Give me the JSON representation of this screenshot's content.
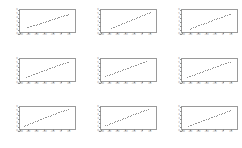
{
  "figure": {
    "title": "",
    "background_color": "#ffffff",
    "frame_color": "#9a9a9a",
    "marker_color": "#6e6e6e",
    "tick_label_color": "#8f8f8f",
    "rows": 3,
    "cols": 3
  },
  "chart_data": [
    {
      "type": "scatter",
      "title": "",
      "xlabel": "",
      "ylabel": "",
      "xlim": [
        -100,
        40
      ],
      "ylim": [
        0,
        6
      ],
      "xticks": [
        -100,
        -80,
        -60,
        -40,
        -20,
        0,
        20
      ],
      "yticks": [
        0,
        1,
        2,
        3,
        4,
        5,
        6
      ],
      "xticklabels": [
        "-100",
        "-80",
        "-60",
        "-40",
        "-20",
        "0",
        "20"
      ],
      "yticklabels": [
        "0",
        "1",
        "2",
        "3",
        "4",
        "5",
        "6"
      ],
      "grid": false,
      "legend": null,
      "x": [
        -82,
        -78,
        -75,
        -71,
        -68,
        -64,
        -60,
        -57,
        -53,
        -49,
        -46,
        -42,
        -38,
        -35,
        -31,
        -27,
        -24,
        -20,
        -16,
        -13,
        -9,
        -5,
        -2,
        2,
        6,
        9,
        13,
        17,
        20
      ],
      "y": [
        1.55,
        1.72,
        1.78,
        1.95,
        2.02,
        2.18,
        2.25,
        2.42,
        2.48,
        2.65,
        2.72,
        2.88,
        2.95,
        3.12,
        3.18,
        3.35,
        3.42,
        3.58,
        3.65,
        3.82,
        3.88,
        4.05,
        4.12,
        4.28,
        4.35,
        4.52,
        4.58,
        4.75,
        4.82
      ]
    },
    {
      "type": "scatter",
      "title": "",
      "xlabel": "",
      "ylabel": "",
      "xlim": [
        -100,
        40
      ],
      "ylim": [
        0,
        6
      ],
      "xticks": [
        -100,
        -80,
        -60,
        -40,
        -20,
        0,
        20
      ],
      "yticks": [
        0,
        1,
        2,
        3,
        4,
        5,
        6
      ],
      "xticklabels": [
        "-100",
        "-80",
        "-60",
        "-40",
        "-20",
        "0",
        "20"
      ],
      "yticklabels": [
        "0",
        "1",
        "2",
        "3",
        "4",
        "5",
        "6"
      ],
      "grid": false,
      "legend": null,
      "x": [
        -74,
        -70,
        -66,
        -62,
        -58,
        -54,
        -50,
        -46,
        -42,
        -38,
        -34,
        -30,
        -26,
        -22,
        -18,
        -14,
        -10,
        -6,
        -2,
        2,
        6,
        10,
        14,
        18,
        22
      ],
      "y": [
        1.32,
        1.52,
        1.68,
        1.85,
        2.02,
        2.18,
        2.35,
        2.52,
        2.68,
        2.85,
        3.02,
        3.18,
        3.35,
        3.52,
        3.68,
        3.85,
        4.02,
        4.18,
        4.35,
        4.52,
        4.68,
        4.85,
        5.02,
        5.15,
        5.28
      ]
    },
    {
      "type": "scatter",
      "title": "",
      "xlabel": "",
      "ylabel": "",
      "xlim": [
        -100,
        40
      ],
      "ylim": [
        0,
        6
      ],
      "xticks": [
        -100,
        -80,
        -60,
        -40,
        -20,
        0,
        20
      ],
      "yticks": [
        0,
        1,
        2,
        3,
        4,
        5,
        6
      ],
      "xticklabels": [
        "-100",
        "-80",
        "-60",
        "-40",
        "-20",
        "0",
        "20"
      ],
      "yticklabels": [
        "0",
        "1",
        "2",
        "3",
        "4",
        "5",
        "6"
      ],
      "grid": false,
      "legend": null,
      "x": [
        -80,
        -76,
        -72,
        -68,
        -64,
        -60,
        -56,
        -52,
        -48,
        -44,
        -40,
        -36,
        -32,
        -28,
        -24,
        -20,
        -16,
        -12,
        -8,
        -4,
        0,
        4,
        8,
        12,
        16,
        20
      ],
      "y": [
        1.25,
        1.42,
        1.55,
        1.72,
        1.85,
        2.02,
        2.15,
        2.32,
        2.45,
        2.62,
        2.75,
        2.92,
        3.05,
        3.22,
        3.35,
        3.52,
        3.65,
        3.82,
        3.95,
        4.12,
        4.25,
        4.42,
        4.55,
        4.72,
        4.85,
        5.0
      ]
    },
    {
      "type": "scatter",
      "title": "",
      "xlabel": "",
      "ylabel": "",
      "xlim": [
        -100,
        40
      ],
      "ylim": [
        0,
        6
      ],
      "xticks": [
        -100,
        -80,
        -60,
        -40,
        -20,
        0,
        20
      ],
      "yticks": [
        0,
        1,
        2,
        3,
        4,
        5,
        6
      ],
      "xticklabels": [
        "-100",
        "-80",
        "-60",
        "-40",
        "-20",
        "0",
        "20"
      ],
      "yticklabels": [
        "0",
        "1",
        "2",
        "3",
        "4",
        "5",
        "6"
      ],
      "grid": false,
      "legend": null,
      "x": [
        -84,
        -80,
        -76,
        -72,
        -68,
        -64,
        -60,
        -56,
        -52,
        -48,
        -44,
        -40,
        -36,
        -32,
        -28,
        -24,
        -20,
        -16,
        -12,
        -8,
        -4,
        0,
        4,
        8,
        12,
        16,
        20
      ],
      "y": [
        1.42,
        1.58,
        1.72,
        1.88,
        2.02,
        2.18,
        2.32,
        2.48,
        2.62,
        2.78,
        2.92,
        3.08,
        3.22,
        3.38,
        3.52,
        3.68,
        3.82,
        3.98,
        4.12,
        4.28,
        4.42,
        4.58,
        4.72,
        4.88,
        5.0,
        5.12,
        5.22
      ]
    },
    {
      "type": "scatter",
      "title": "",
      "xlabel": "",
      "ylabel": "",
      "xlim": [
        -100,
        40
      ],
      "ylim": [
        0,
        6
      ],
      "xticks": [
        -100,
        -80,
        -60,
        -40,
        -20,
        0,
        20
      ],
      "yticks": [
        0,
        1,
        2,
        3,
        4,
        5,
        6
      ],
      "xticklabels": [
        "-100",
        "-80",
        "-60",
        "-40",
        "-20",
        "0",
        "20"
      ],
      "yticklabels": [
        "0",
        "1",
        "2",
        "3",
        "4",
        "5",
        "6"
      ],
      "grid": false,
      "legend": null,
      "x": [
        -88,
        -84,
        -80,
        -76,
        -72,
        -68,
        -64,
        -60,
        -56,
        -52,
        -48,
        -44,
        -40,
        -36,
        -32,
        -28,
        -24,
        -20,
        -16,
        -12,
        -8,
        -4,
        0,
        4,
        8,
        12
      ],
      "y": [
        1.62,
        1.78,
        1.92,
        2.08,
        2.22,
        2.38,
        2.52,
        2.68,
        2.82,
        2.98,
        3.12,
        3.28,
        3.42,
        3.58,
        3.72,
        3.88,
        4.02,
        4.18,
        4.32,
        4.48,
        4.62,
        4.78,
        4.92,
        5.05,
        5.18,
        5.3
      ]
    },
    {
      "type": "scatter",
      "title": "",
      "xlabel": "",
      "ylabel": "",
      "xlim": [
        -100,
        40
      ],
      "ylim": [
        0,
        6
      ],
      "xticks": [
        -100,
        -80,
        -60,
        -40,
        -20,
        0,
        20
      ],
      "yticks": [
        0,
        1,
        2,
        3,
        4,
        5,
        6
      ],
      "xticklabels": [
        "-100",
        "-80",
        "-60",
        "-40",
        "-20",
        "0",
        "20"
      ],
      "yticklabels": [
        "0",
        "1",
        "2",
        "3",
        "4",
        "5",
        "6"
      ],
      "grid": false,
      "legend": null,
      "x": [
        -86,
        -82,
        -78,
        -74,
        -70,
        -66,
        -62,
        -58,
        -54,
        -50,
        -46,
        -42,
        -38,
        -34,
        -30,
        -26,
        -22,
        -18,
        -14,
        -10,
        -6,
        -2,
        2,
        6,
        10,
        14,
        18
      ],
      "y": [
        1.35,
        1.52,
        1.66,
        1.82,
        1.96,
        2.12,
        2.26,
        2.42,
        2.56,
        2.72,
        2.86,
        3.02,
        3.16,
        3.32,
        3.46,
        3.62,
        3.76,
        3.92,
        4.06,
        4.22,
        4.36,
        4.52,
        4.66,
        4.82,
        4.96,
        5.1,
        5.22
      ]
    },
    {
      "type": "scatter",
      "title": "",
      "xlabel": "",
      "ylabel": "",
      "xlim": [
        -100,
        40
      ],
      "ylim": [
        0,
        6
      ],
      "xticks": [
        -100,
        -80,
        -60,
        -40,
        -20,
        0,
        20
      ],
      "yticks": [
        0,
        1,
        2,
        3,
        4,
        5,
        6
      ],
      "xticklabels": [
        "-100",
        "-80",
        "-60",
        "-40",
        "-20",
        "0",
        "20"
      ],
      "yticklabels": [
        "0",
        "1",
        "2",
        "3",
        "4",
        "5",
        "6"
      ],
      "grid": false,
      "legend": null,
      "x": [
        -90,
        -86,
        -82,
        -78,
        -74,
        -70,
        -66,
        -62,
        -58,
        -54,
        -50,
        -46,
        -42,
        -38,
        -34,
        -30,
        -26,
        -22,
        -18,
        -14,
        -10,
        -6,
        -2,
        2,
        6,
        10,
        14,
        18
      ],
      "y": [
        1.18,
        1.35,
        1.5,
        1.66,
        1.82,
        1.98,
        2.14,
        2.3,
        2.46,
        2.62,
        2.78,
        2.94,
        3.1,
        3.26,
        3.42,
        3.58,
        3.74,
        3.9,
        4.06,
        4.22,
        4.38,
        4.54,
        4.7,
        4.86,
        5.0,
        5.12,
        5.24,
        5.35
      ]
    },
    {
      "type": "scatter",
      "title": "",
      "xlabel": "",
      "ylabel": "",
      "xlim": [
        -100,
        40
      ],
      "ylim": [
        0,
        6
      ],
      "xticks": [
        -100,
        -80,
        -60,
        -40,
        -20,
        0,
        20
      ],
      "yticks": [
        0,
        1,
        2,
        3,
        4,
        5,
        6
      ],
      "xticklabels": [
        "-100",
        "-80",
        "-60",
        "-40",
        "-20",
        "0",
        "20"
      ],
      "yticklabels": [
        "0",
        "1",
        "2",
        "3",
        "4",
        "5",
        "6"
      ],
      "grid": false,
      "legend": null,
      "x": [
        -88,
        -84,
        -80,
        -76,
        -72,
        -68,
        -64,
        -60,
        -56,
        -52,
        -48,
        -44,
        -40,
        -36,
        -32,
        -28,
        -24,
        -20,
        -16,
        -12,
        -8,
        -4,
        0,
        4,
        8,
        12,
        16
      ],
      "y": [
        1.3,
        1.46,
        1.62,
        1.78,
        1.94,
        2.1,
        2.26,
        2.42,
        2.58,
        2.74,
        2.9,
        3.06,
        3.22,
        3.38,
        3.54,
        3.7,
        3.86,
        4.02,
        4.18,
        4.34,
        4.5,
        4.66,
        4.82,
        4.96,
        5.1,
        5.22,
        5.34
      ]
    },
    {
      "type": "scatter",
      "title": "",
      "xlabel": "",
      "ylabel": "",
      "xlim": [
        -100,
        40
      ],
      "ylim": [
        0,
        6
      ],
      "xticks": [
        -100,
        -80,
        -60,
        -40,
        -20,
        0,
        20
      ],
      "yticks": [
        0,
        1,
        2,
        3,
        4,
        5,
        6
      ],
      "xticklabels": [
        "-100",
        "-80",
        "-60",
        "-40",
        "-20",
        "0",
        "20"
      ],
      "yticklabels": [
        "0",
        "1",
        "2",
        "3",
        "4",
        "5",
        "6"
      ],
      "grid": false,
      "legend": null,
      "x": [
        -84,
        -80,
        -76,
        -72,
        -68,
        -64,
        -60,
        -56,
        -52,
        -48,
        -44,
        -40,
        -36,
        -32,
        -28,
        -24,
        -20,
        -16,
        -12,
        -8,
        -4,
        0,
        4,
        8,
        12,
        16,
        20
      ],
      "y": [
        1.22,
        1.36,
        1.5,
        1.64,
        1.78,
        1.94,
        2.08,
        2.24,
        2.38,
        2.54,
        2.68,
        2.84,
        2.98,
        3.14,
        3.28,
        3.44,
        3.58,
        3.74,
        3.88,
        4.04,
        4.18,
        4.34,
        4.48,
        4.62,
        4.76,
        4.9,
        5.02
      ]
    }
  ]
}
